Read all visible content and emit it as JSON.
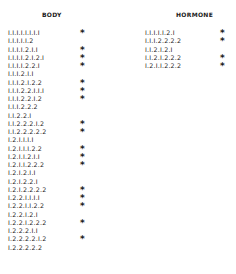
{
  "body": {
    "title": "BODY",
    "rows": [
      {
        "code": "I.I.I.I.I.I.I.I",
        "mark": "*"
      },
      {
        "code": "I.I.I.I.I.2",
        "mark": ""
      },
      {
        "code": "I.I.I.I.2.I.I",
        "mark": "*"
      },
      {
        "code": "I.I.I.I.2.I.2.I",
        "mark": "*"
      },
      {
        "code": "I.I.I.I.2.2.I",
        "mark": "*"
      },
      {
        "code": "I.I.I.2.I.I",
        "mark": ""
      },
      {
        "code": "I.I.I.2.I.2.2",
        "mark": "*"
      },
      {
        "code": "I.I.I.2.2.I.I.I",
        "mark": "*"
      },
      {
        "code": "I.I.I.2.2.I.2",
        "mark": "*"
      },
      {
        "code": "I.I.I.2.2.2",
        "mark": ""
      },
      {
        "code": "I.I.2.2.I",
        "mark": ""
      },
      {
        "code": "I.I.2.2.2.I.2",
        "mark": "*"
      },
      {
        "code": "I.I.2.2.2.2.2",
        "mark": "*"
      },
      {
        "code": "I.2.I.I.I.I",
        "mark": ""
      },
      {
        "code": "I.2.I.I.I.2.2",
        "mark": "*"
      },
      {
        "code": "I.2.I.I.2.I.I",
        "mark": "*"
      },
      {
        "code": "I.2.I.I.2.2.2",
        "mark": "*"
      },
      {
        "code": "I.2.I.2.I.I",
        "mark": ""
      },
      {
        "code": "I.2.I.2.2.I",
        "mark": ""
      },
      {
        "code": "I.2.I.2.2.2.2",
        "mark": "*"
      },
      {
        "code": "I.2.2.I.I.I.I",
        "mark": "*"
      },
      {
        "code": "I.2.2.I.I.2.2",
        "mark": "*"
      },
      {
        "code": "I.2.2.I.2.I",
        "mark": ""
      },
      {
        "code": "I.2.2.I.2.2.2",
        "mark": "*"
      },
      {
        "code": "I.2.2.2.I.I",
        "mark": ""
      },
      {
        "code": "I.2.2.2.2.I.2",
        "mark": "*"
      },
      {
        "code": "I.2.2.2.2.2",
        "mark": ""
      }
    ]
  },
  "hormone": {
    "title": "HORMONE",
    "rows": [
      {
        "code": "I.I.I.I.I.2.I",
        "mark": "*"
      },
      {
        "code": "I.I.I.2.2.2.2",
        "mark": "*"
      },
      {
        "code": "I.I.2.I.2.I",
        "mark": ""
      },
      {
        "code": "I.I.2.I.2.2.2",
        "mark": "*"
      },
      {
        "code": "I.2.I.I.2.2.2",
        "mark": "*"
      }
    ]
  }
}
